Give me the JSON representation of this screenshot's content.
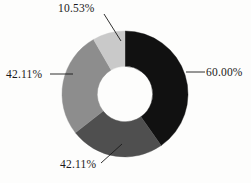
{
  "chart_data": {
    "type": "pie",
    "variant": "donut",
    "title": "",
    "subtitle": "",
    "xlabel": "",
    "ylabel": "",
    "legend": false,
    "grid": false,
    "hole_ratio": 0.44,
    "labels_shown_as": "percent",
    "categories": [
      "60.00%",
      "42.11%",
      "42.11%",
      "10.53%"
    ],
    "values": [
      60.0,
      42.11,
      42.11,
      10.53
    ],
    "colors": [
      "#111111",
      "#4f4f4f",
      "#8d8d8d",
      "#c9c9c9"
    ],
    "slices": [
      {
        "label": "60.00%",
        "value": 60.0,
        "color": "#111111",
        "start_angle_deg": 0,
        "end_angle_deg": 145,
        "label_position": "right"
      },
      {
        "label": "42.11%",
        "value": 42.11,
        "color": "#4f4f4f",
        "start_angle_deg": 145,
        "end_angle_deg": 232,
        "label_position": "bottom"
      },
      {
        "label": "42.11%",
        "value": 42.11,
        "color": "#8d8d8d",
        "start_angle_deg": 232,
        "end_angle_deg": 330,
        "label_position": "left"
      },
      {
        "label": "10.53%",
        "value": 10.53,
        "color": "#c9c9c9",
        "start_angle_deg": 330,
        "end_angle_deg": 360,
        "label_position": "top"
      }
    ]
  },
  "labels": {
    "top": "10.53%",
    "right": "60.00%",
    "left": "42.11%",
    "bottom": "42.11%"
  },
  "style": {
    "background": "#fdfdfc",
    "leader_line_color": "#1a1a1a",
    "hole_color": "#ffffff"
  }
}
